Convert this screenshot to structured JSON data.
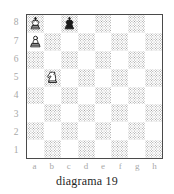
{
  "figure": {
    "caption": "diagrama 19",
    "colors": {
      "light_square": "#ffffff",
      "dark_square_stipple": "#9d9d9d",
      "border": "#4a4a4a",
      "coordinate_label": "#a8a8a8",
      "caption_text": "#1f1f1f",
      "piece_outline": "#1a1a1a",
      "white_piece_fill": "#ffffff",
      "black_piece_fill": "#1a1a1a"
    }
  },
  "board": {
    "rank_labels": [
      "8",
      "7",
      "6",
      "5",
      "4",
      "3",
      "2",
      "1"
    ],
    "file_labels": [
      "a",
      "b",
      "c",
      "d",
      "e",
      "f",
      "g",
      "h"
    ],
    "orientation": "white-bottom",
    "squares": [
      [
        {
          "square": "a8",
          "shade": "dark",
          "piece": "white-king"
        },
        {
          "square": "b8",
          "shade": "light",
          "piece": null
        },
        {
          "square": "c8",
          "shade": "dark",
          "piece": "black-king"
        },
        {
          "square": "d8",
          "shade": "light",
          "piece": null
        },
        {
          "square": "e8",
          "shade": "dark",
          "piece": null
        },
        {
          "square": "f8",
          "shade": "light",
          "piece": null
        },
        {
          "square": "g8",
          "shade": "dark",
          "piece": null
        },
        {
          "square": "h8",
          "shade": "light",
          "piece": null
        }
      ],
      [
        {
          "square": "a7",
          "shade": "light",
          "piece": "white-pawn"
        },
        {
          "square": "b7",
          "shade": "dark",
          "piece": null
        },
        {
          "square": "c7",
          "shade": "light",
          "piece": null
        },
        {
          "square": "d7",
          "shade": "dark",
          "piece": null
        },
        {
          "square": "e7",
          "shade": "light",
          "piece": null
        },
        {
          "square": "f7",
          "shade": "dark",
          "piece": null
        },
        {
          "square": "g7",
          "shade": "light",
          "piece": null
        },
        {
          "square": "h7",
          "shade": "dark",
          "piece": null
        }
      ],
      [
        {
          "square": "a6",
          "shade": "dark",
          "piece": null
        },
        {
          "square": "b6",
          "shade": "light",
          "piece": null
        },
        {
          "square": "c6",
          "shade": "dark",
          "piece": null
        },
        {
          "square": "d6",
          "shade": "light",
          "piece": null
        },
        {
          "square": "e6",
          "shade": "dark",
          "piece": null
        },
        {
          "square": "f6",
          "shade": "light",
          "piece": null
        },
        {
          "square": "g6",
          "shade": "dark",
          "piece": null
        },
        {
          "square": "h6",
          "shade": "light",
          "piece": null
        }
      ],
      [
        {
          "square": "a5",
          "shade": "light",
          "piece": null
        },
        {
          "square": "b5",
          "shade": "dark",
          "piece": "white-knight"
        },
        {
          "square": "c5",
          "shade": "light",
          "piece": null
        },
        {
          "square": "d5",
          "shade": "dark",
          "piece": null
        },
        {
          "square": "e5",
          "shade": "light",
          "piece": null
        },
        {
          "square": "f5",
          "shade": "dark",
          "piece": null
        },
        {
          "square": "g5",
          "shade": "light",
          "piece": null
        },
        {
          "square": "h5",
          "shade": "dark",
          "piece": null
        }
      ],
      [
        {
          "square": "a4",
          "shade": "dark",
          "piece": null
        },
        {
          "square": "b4",
          "shade": "light",
          "piece": null
        },
        {
          "square": "c4",
          "shade": "dark",
          "piece": null
        },
        {
          "square": "d4",
          "shade": "light",
          "piece": null
        },
        {
          "square": "e4",
          "shade": "dark",
          "piece": null
        },
        {
          "square": "f4",
          "shade": "light",
          "piece": null
        },
        {
          "square": "g4",
          "shade": "dark",
          "piece": null
        },
        {
          "square": "h4",
          "shade": "light",
          "piece": null
        }
      ],
      [
        {
          "square": "a3",
          "shade": "light",
          "piece": null
        },
        {
          "square": "b3",
          "shade": "dark",
          "piece": null
        },
        {
          "square": "c3",
          "shade": "light",
          "piece": null
        },
        {
          "square": "d3",
          "shade": "dark",
          "piece": null
        },
        {
          "square": "e3",
          "shade": "light",
          "piece": null
        },
        {
          "square": "f3",
          "shade": "dark",
          "piece": null
        },
        {
          "square": "g3",
          "shade": "light",
          "piece": null
        },
        {
          "square": "h3",
          "shade": "dark",
          "piece": null
        }
      ],
      [
        {
          "square": "a2",
          "shade": "dark",
          "piece": null
        },
        {
          "square": "b2",
          "shade": "light",
          "piece": null
        },
        {
          "square": "c2",
          "shade": "dark",
          "piece": null
        },
        {
          "square": "d2",
          "shade": "light",
          "piece": null
        },
        {
          "square": "e2",
          "shade": "dark",
          "piece": null
        },
        {
          "square": "f2",
          "shade": "light",
          "piece": null
        },
        {
          "square": "g2",
          "shade": "dark",
          "piece": null
        },
        {
          "square": "h2",
          "shade": "light",
          "piece": null
        }
      ],
      [
        {
          "square": "a1",
          "shade": "light",
          "piece": null
        },
        {
          "square": "b1",
          "shade": "dark",
          "piece": null
        },
        {
          "square": "c1",
          "shade": "light",
          "piece": null
        },
        {
          "square": "d1",
          "shade": "dark",
          "piece": null
        },
        {
          "square": "e1",
          "shade": "light",
          "piece": null
        },
        {
          "square": "f1",
          "shade": "dark",
          "piece": null
        },
        {
          "square": "g1",
          "shade": "light",
          "piece": null
        },
        {
          "square": "h1",
          "shade": "dark",
          "piece": null
        }
      ]
    ],
    "pieces": [
      {
        "piece": "white-king",
        "square": "a8",
        "color": "white",
        "type": "king"
      },
      {
        "piece": "black-king",
        "square": "c8",
        "color": "black",
        "type": "king"
      },
      {
        "piece": "white-pawn",
        "square": "a7",
        "color": "white",
        "type": "pawn"
      },
      {
        "piece": "white-knight",
        "square": "b5",
        "color": "white",
        "type": "knight"
      }
    ]
  }
}
